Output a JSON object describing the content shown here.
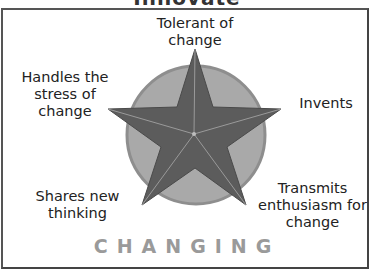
{
  "diagram": {
    "title_partial": "Innovate",
    "footer": "CHANGING",
    "points": [
      {
        "id": "top",
        "label_lines": [
          "Tolerant of",
          "change"
        ]
      },
      {
        "id": "left",
        "label_lines": [
          "Handles the",
          "stress of",
          "change"
        ]
      },
      {
        "id": "right",
        "label_lines": [
          "Invents"
        ]
      },
      {
        "id": "bottom-left",
        "label_lines": [
          "Shares new",
          "thinking"
        ]
      },
      {
        "id": "bottom-right",
        "label_lines": [
          "Transmits",
          "enthusiasm for",
          "change"
        ]
      }
    ],
    "colors": {
      "circle": "#a9a9a9",
      "circle_edge": "#8a8a8a",
      "star": "#5c5c5c",
      "star_lines": "#9a9a9a",
      "footer_text": "#9a9a9a"
    }
  }
}
